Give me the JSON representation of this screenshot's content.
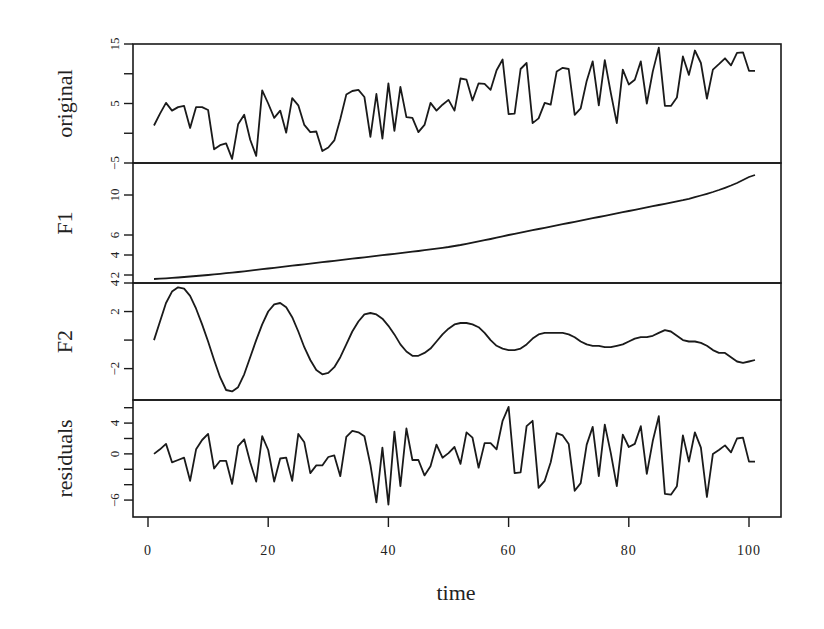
{
  "chart_data": {
    "type": "line",
    "title": "",
    "xlabel": "time",
    "x_ticks": [
      0,
      20,
      40,
      60,
      80,
      100
    ],
    "x_range": [
      1,
      101
    ],
    "grid": false,
    "legend": null,
    "panels": [
      {
        "name": "original",
        "ylabel": "original",
        "y_ticks": [
          -5,
          5,
          15
        ],
        "y_minor_ticks": [
          0,
          10
        ],
        "ylim": [
          -5,
          15
        ],
        "values": [
          1.3,
          3.3,
          5.1,
          3.8,
          4.4,
          4.6,
          0.9,
          4.4,
          4.4,
          3.9,
          -2.7,
          -2.0,
          -1.7,
          -4.3,
          1.5,
          3.1,
          -1.1,
          -3.8,
          7.2,
          5.0,
          2.6,
          3.8,
          0.1,
          5.9,
          4.7,
          1.4,
          0.2,
          0.3,
          -3.0,
          -2.4,
          -1.2,
          2.4,
          6.5,
          7.1,
          7.3,
          6.1,
          -0.6,
          6.6,
          -0.9,
          8.4,
          0.4,
          7.8,
          2.7,
          2.6,
          0.2,
          1.4,
          5.1,
          3.8,
          4.8,
          5.6,
          3.8,
          9.2,
          9.0,
          5.5,
          8.4,
          8.3,
          7.3,
          10.6,
          12.4,
          3.2,
          3.3,
          10.8,
          11.8,
          1.7,
          2.5,
          5.1,
          4.8,
          10.4,
          11.0,
          10.8,
          3.1,
          4.2,
          8.8,
          12.1,
          4.7,
          12.3,
          6.8,
          1.7,
          10.7,
          8.2,
          9.0,
          12.1,
          5.0,
          10.4,
          14.4,
          4.6,
          4.6,
          6.0,
          12.9,
          9.8,
          13.9,
          11.8,
          5.8,
          10.7,
          11.6,
          12.6,
          11.4,
          13.5,
          13.6,
          10.5,
          10.5
        ]
      },
      {
        "name": "F1",
        "ylabel": "F1",
        "y_ticks": [
          2,
          4,
          6,
          10
        ],
        "ylim": [
          1.2,
          13.2
        ],
        "values": [
          1.6,
          1.63,
          1.67,
          1.71,
          1.75,
          1.8,
          1.85,
          1.9,
          1.95,
          2.0,
          2.06,
          2.12,
          2.18,
          2.24,
          2.3,
          2.37,
          2.44,
          2.51,
          2.58,
          2.65,
          2.72,
          2.79,
          2.86,
          2.93,
          3.0,
          3.07,
          3.14,
          3.21,
          3.28,
          3.35,
          3.42,
          3.49,
          3.56,
          3.63,
          3.7,
          3.77,
          3.84,
          3.91,
          3.98,
          4.05,
          4.12,
          4.19,
          4.26,
          4.33,
          4.4,
          4.48,
          4.56,
          4.64,
          4.72,
          4.8,
          4.9,
          5.0,
          5.12,
          5.24,
          5.36,
          5.48,
          5.6,
          5.73,
          5.86,
          6.0,
          6.12,
          6.24,
          6.36,
          6.48,
          6.6,
          6.72,
          6.84,
          6.96,
          7.08,
          7.2,
          7.32,
          7.44,
          7.56,
          7.68,
          7.8,
          7.92,
          8.04,
          8.16,
          8.28,
          8.4,
          8.52,
          8.64,
          8.76,
          8.88,
          9.0,
          9.12,
          9.24,
          9.36,
          9.48,
          9.62,
          9.78,
          9.95,
          10.12,
          10.3,
          10.5,
          10.72,
          10.95,
          11.2,
          11.5,
          11.8,
          12.0
        ]
      },
      {
        "name": "F2",
        "ylabel": "F2",
        "y_ticks": [
          -2,
          2,
          4
        ],
        "y_minor_ticks": [
          0
        ],
        "ylim": [
          -4.2,
          4.0
        ],
        "values": [
          0.0,
          1.3,
          2.6,
          3.4,
          3.7,
          3.6,
          3.1,
          2.2,
          1.1,
          -0.1,
          -1.4,
          -2.6,
          -3.5,
          -3.6,
          -3.3,
          -2.4,
          -1.2,
          0.0,
          1.1,
          2.0,
          2.5,
          2.6,
          2.3,
          1.6,
          0.6,
          -0.5,
          -1.4,
          -2.1,
          -2.4,
          -2.3,
          -1.9,
          -1.2,
          -0.3,
          0.6,
          1.3,
          1.8,
          1.9,
          1.8,
          1.5,
          1.0,
          0.4,
          -0.3,
          -0.8,
          -1.1,
          -1.1,
          -0.9,
          -0.6,
          -0.1,
          0.4,
          0.8,
          1.1,
          1.2,
          1.2,
          1.1,
          0.9,
          0.5,
          0.0,
          -0.4,
          -0.6,
          -0.7,
          -0.7,
          -0.6,
          -0.3,
          0.1,
          0.4,
          0.5,
          0.5,
          0.5,
          0.5,
          0.4,
          0.2,
          -0.1,
          -0.3,
          -0.4,
          -0.4,
          -0.5,
          -0.5,
          -0.4,
          -0.3,
          -0.1,
          0.1,
          0.2,
          0.2,
          0.3,
          0.5,
          0.7,
          0.6,
          0.3,
          0.0,
          -0.1,
          -0.1,
          -0.2,
          -0.4,
          -0.7,
          -0.9,
          -0.9,
          -1.2,
          -1.5,
          -1.6,
          -1.5,
          -1.4
        ]
      },
      {
        "name": "residuals",
        "ylabel": "residuals",
        "y_ticks": [
          -6,
          0,
          4
        ],
        "y_minor_ticks": [
          -4,
          -2,
          2,
          6
        ],
        "ylim": [
          -8.2,
          7.0
        ],
        "values": [
          0.0,
          0.6,
          1.3,
          -1.1,
          -0.8,
          -0.5,
          -3.5,
          0.6,
          1.8,
          2.6,
          -1.9,
          -0.9,
          -0.9,
          -3.9,
          1.0,
          1.9,
          -1.1,
          -3.6,
          2.3,
          0.5,
          -3.6,
          -0.6,
          -0.5,
          -3.5,
          2.6,
          1.5,
          -2.5,
          -1.5,
          -1.5,
          -0.4,
          -0.2,
          -2.9,
          2.2,
          3.0,
          2.8,
          2.3,
          -1.4,
          -6.3,
          0.8,
          -6.6,
          2.9,
          -4.2,
          3.3,
          -0.8,
          -0.8,
          -2.8,
          -1.6,
          1.2,
          -0.5,
          0.1,
          0.9,
          -1.3,
          2.8,
          2.1,
          -1.8,
          1.4,
          1.4,
          0.6,
          4.3,
          6.1,
          -2.5,
          -2.4,
          3.6,
          4.3,
          -4.4,
          -3.5,
          -1.1,
          2.7,
          2.4,
          1.3,
          -4.8,
          -3.8,
          1.2,
          3.5,
          -2.9,
          3.8,
          0.1,
          -4.2,
          2.5,
          0.9,
          1.3,
          3.6,
          -2.6,
          1.7,
          4.9,
          -5.2,
          -5.3,
          -4.2,
          2.4,
          -1.0,
          2.8,
          0.8,
          -5.6,
          0.0,
          0.5,
          1.1,
          0.2,
          2.0,
          2.1,
          -1.0,
          -1.0
        ]
      }
    ]
  }
}
